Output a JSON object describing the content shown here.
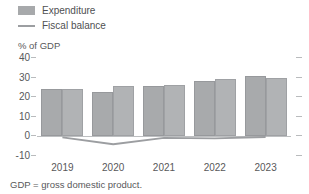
{
  "chart_data": {
    "type": "bar",
    "title": "",
    "subtitle": "",
    "xlabel": "",
    "ylabel": "% of GDP",
    "ylim": [
      -10,
      40
    ],
    "yticks": [
      40,
      30,
      20,
      10,
      0,
      -10
    ],
    "ytick_labels": [
      "40",
      "30",
      "20",
      "10",
      "0",
      "-10"
    ],
    "grid": false,
    "legend_position": "top-left",
    "categories": [
      "2019",
      "2020",
      "2021",
      "2022",
      "2023"
    ],
    "series": [
      {
        "name": "Expenditure",
        "type": "bar",
        "color": "#a8aaac",
        "values": [
          24.3,
          22.8,
          25.8,
          28.4,
          30.6
        ]
      },
      {
        "name": "Expenditure (second bar)",
        "type": "bar",
        "color": "#b1b3b5",
        "values": [
          24.3,
          25.7,
          26.0,
          29.2,
          29.8
        ]
      },
      {
        "name": "Fiscal balance",
        "type": "line",
        "color": "#9c9ea1",
        "values": [
          -0.5,
          -4.0,
          -0.8,
          -1.0,
          -0.3
        ]
      }
    ],
    "annotations": [
      "GDP = gross domestic product."
    ]
  },
  "legend": {
    "items": [
      {
        "label": "Expenditure",
        "marker": "box",
        "color": "#a7a9ab"
      },
      {
        "label": "Fiscal balance",
        "marker": "line",
        "color": "#9c9ea1"
      }
    ]
  },
  "axis": {
    "y_title": "% of GDP",
    "y_ticks": [
      "40",
      "30",
      "20",
      "10",
      "0",
      "-10"
    ],
    "x_ticks": [
      "2019",
      "2020",
      "2021",
      "2022",
      "2023"
    ]
  },
  "footnote": "GDP = gross domestic product.",
  "colors": {
    "bar_primary": "#a8aaac",
    "bar_secondary": "#b1b3b5",
    "line": "#9c9ea1",
    "text": "#58585a",
    "axis": "#bdbfc1",
    "background": "#ffffff"
  }
}
